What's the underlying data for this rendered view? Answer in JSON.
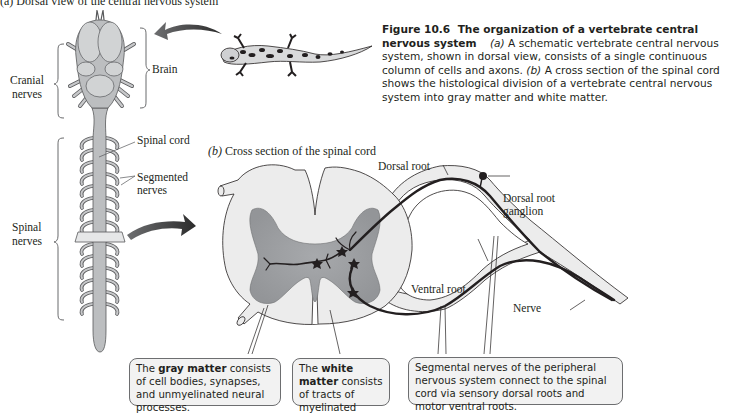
{
  "figure": {
    "part_a_title": "(a) Dorsal view of the central nervous system",
    "part_b_label": "(b)",
    "part_b_title": "Cross section of the spinal cord",
    "caption": {
      "number": "Figure 10.6",
      "title": "The organization of a vertebrate central nervous system",
      "a_marker": "(a)",
      "a_text": "A schematic vertebrate central nervous system, shown in dorsal view, consists of a single continuous column of cells and axons.",
      "b_marker": "(b)",
      "b_text": "A cross section of the spinal cord shows the histological division of a vertebrate central nervous system into gray matter and white matter."
    }
  },
  "dorsal_view_labels": {
    "brain": "Brain",
    "cranial_nerves_line1": "Cranial",
    "cranial_nerves_line2": "nerves",
    "spinal_cord": "Spinal cord",
    "segmented_nerves_line1": "Segmented",
    "segmented_nerves_line2": "nerves",
    "spinal_nerves_line1": "Spinal",
    "spinal_nerves_line2": "nerves"
  },
  "cross_section_labels": {
    "dorsal_root": "Dorsal root",
    "dorsal_root_ganglion_line1": "Dorsal root",
    "dorsal_root_ganglion_line2": "ganglion",
    "ventral_root": "Ventral root",
    "nerve": "Nerve"
  },
  "callouts": {
    "gray_matter": {
      "prefix": "The ",
      "term": "gray matter",
      "text": " consists of cell bodies, synapses, and unmyelinated neural processes."
    },
    "white_matter": {
      "prefix": "The ",
      "term": "white matter",
      "text": " consists of tracts of myelinated axons."
    },
    "segmental_nerves": {
      "text": "Segmental nerves of the peripheral nervous system connect to the spinal cord via sensory dorsal roots and motor ventral roots."
    }
  },
  "colors": {
    "gray_matter": "#9d9fa2",
    "white_matter": "#ececec",
    "outline": "#231f20",
    "callout_bg": "#f2f2f2",
    "callout_border": "#6d6e70",
    "arrow": "#3a3a3a"
  }
}
